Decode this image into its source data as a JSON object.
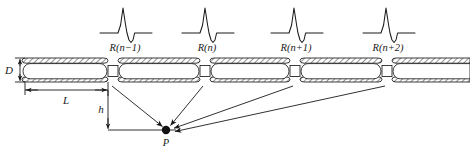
{
  "figure": {
    "type": "pipeline-reflection-diagram",
    "background": "#ffffff",
    "stroke_color": "#1a1a1a",
    "hatch_color": "#555555",
    "width": 470,
    "height": 152
  },
  "waveforms": {
    "description": "reflection pulse: flat baseline, sharp positive spike, negative undershoot, flat baseline",
    "items": [
      {
        "label": "R(n−1)",
        "cx": 125,
        "baseline_y": 33
      },
      {
        "label": "R(n)",
        "cx": 207,
        "baseline_y": 33
      },
      {
        "label": "R(n+1)",
        "cx": 296,
        "baseline_y": 33
      },
      {
        "label": "R(n+2)",
        "cx": 388,
        "baseline_y": 33
      }
    ]
  },
  "pipe": {
    "top_y": 58,
    "bottom_y": 82,
    "wall_thickness": 5,
    "segments": [
      {
        "x1": 22,
        "x2": 108
      },
      {
        "x1": 118,
        "x2": 200
      },
      {
        "x1": 210,
        "x2": 290
      },
      {
        "x1": 300,
        "x2": 382
      },
      {
        "x1": 392,
        "x2": 468
      }
    ],
    "joints": [
      {
        "cx": 113,
        "label_ref": "R(n−1)"
      },
      {
        "cx": 205,
        "label_ref": "R(n)"
      },
      {
        "cx": 295,
        "label_ref": "R(n+1)"
      },
      {
        "cx": 387,
        "label_ref": "R(n+2)"
      }
    ]
  },
  "dimensions": {
    "diameter": {
      "symbol": "D",
      "x": 10,
      "y_top": 60,
      "y_bottom": 81
    },
    "length": {
      "symbol": "L",
      "x1": 25,
      "x2": 108,
      "y": 90
    },
    "height": {
      "symbol": "h",
      "x": 108,
      "y_top": 88,
      "y_bottom": 130
    }
  },
  "point": {
    "symbol": "P",
    "x": 166,
    "y": 130,
    "radius": 4.2
  },
  "rays": {
    "description": "straight ray paths from each pipe joint down to observation point P",
    "from_joints": [
      113,
      205,
      295,
      387
    ],
    "joint_y": 84,
    "to": {
      "x": 166,
      "y": 130
    }
  },
  "baseline": {
    "from_x": 108,
    "to_x": 172,
    "y": 130
  }
}
